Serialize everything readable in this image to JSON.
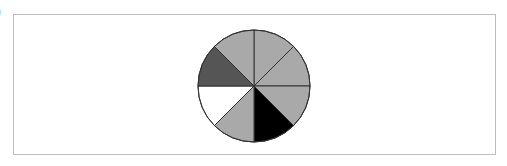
{
  "figure": {
    "edge_label": ")",
    "circle": {
      "cx": 254,
      "cy": 86,
      "r": 56,
      "stroke": "#333333"
    },
    "sectors": [
      {
        "index": 1,
        "start_deg": 0,
        "end_deg": 45,
        "fill": "#a9a9a9",
        "shade": "light-gray"
      },
      {
        "index": 2,
        "start_deg": 45,
        "end_deg": 90,
        "fill": "#a9a9a9",
        "shade": "light-gray"
      },
      {
        "index": 3,
        "start_deg": 90,
        "end_deg": 135,
        "fill": "#a9a9a9",
        "shade": "light-gray"
      },
      {
        "index": 4,
        "start_deg": 135,
        "end_deg": 180,
        "fill": "#000000",
        "shade": "black"
      },
      {
        "index": 5,
        "start_deg": 180,
        "end_deg": 225,
        "fill": "#a9a9a9",
        "shade": "light-gray"
      },
      {
        "index": 6,
        "start_deg": 225,
        "end_deg": 270,
        "fill": "#ffffff",
        "shade": "white"
      },
      {
        "index": 7,
        "start_deg": 270,
        "end_deg": 315,
        "fill": "#555555",
        "shade": "dark-gray"
      },
      {
        "index": 8,
        "start_deg": 315,
        "end_deg": 360,
        "fill": "#a9a9a9",
        "shade": "light-gray"
      }
    ],
    "counts": {
      "total": 8,
      "light_gray": 5,
      "black": 1,
      "white": 1,
      "dark_gray": 1
    }
  }
}
